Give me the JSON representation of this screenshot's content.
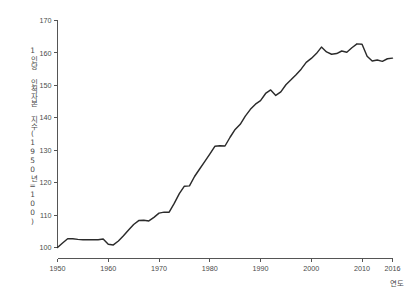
{
  "chart_data": {
    "type": "line",
    "title": "",
    "xlabel": "연도",
    "ylabel": "1인당 인적자본 지수(1950년=100)",
    "xlim": [
      1950,
      2016
    ],
    "ylim": [
      100,
      170
    ],
    "grid": false,
    "legend": "none",
    "xticks": [
      "1950",
      "1960",
      "1970",
      "1980",
      "1990",
      "2000",
      "2010",
      "2016"
    ],
    "xtick_values": [
      1950,
      1960,
      1970,
      1980,
      1990,
      2000,
      2010,
      2016
    ],
    "yticks": [
      "100",
      "110",
      "120",
      "130",
      "140",
      "150",
      "160",
      "170"
    ],
    "ytick_values": [
      100,
      110,
      120,
      130,
      140,
      150,
      160,
      170
    ],
    "line_color": "#2b2b2b",
    "axis_color": "#555555",
    "background_color": "#ffffff",
    "series": [
      {
        "name": "1인당 인적자본 지수",
        "x": [
          1950,
          1951,
          1952,
          1953,
          1954,
          1955,
          1956,
          1957,
          1958,
          1959,
          1960,
          1961,
          1962,
          1963,
          1964,
          1965,
          1966,
          1967,
          1968,
          1969,
          1970,
          1971,
          1972,
          1973,
          1974,
          1975,
          1976,
          1977,
          1978,
          1979,
          1980,
          1981,
          1982,
          1983,
          1984,
          1985,
          1986,
          1987,
          1988,
          1989,
          1990,
          1991,
          1992,
          1993,
          1994,
          1995,
          1996,
          1997,
          1998,
          1999,
          2000,
          2001,
          2002,
          2003,
          2004,
          2005,
          2006,
          2007,
          2008,
          2009,
          2010,
          2011,
          2012,
          2013,
          2014,
          2015,
          2016
        ],
        "values": [
          100.0,
          101.4,
          102.7,
          102.7,
          102.5,
          102.4,
          102.4,
          102.4,
          102.4,
          102.6,
          101.0,
          100.8,
          102.0,
          103.6,
          105.4,
          107.1,
          108.3,
          108.4,
          108.2,
          109.3,
          110.6,
          110.9,
          110.9,
          113.6,
          116.6,
          118.9,
          119.0,
          121.9,
          124.2,
          126.5,
          128.8,
          131.2,
          131.4,
          131.3,
          134.0,
          136.4,
          138.0,
          140.5,
          142.6,
          144.2,
          145.3,
          147.5,
          148.6,
          146.9,
          148.0,
          150.2,
          151.7,
          153.3,
          155.0,
          157.1,
          158.3,
          159.8,
          161.8,
          160.3,
          159.6,
          159.8,
          160.6,
          160.2,
          161.6,
          162.8,
          162.7,
          159.0,
          157.5,
          157.8,
          157.4,
          158.2,
          158.4
        ]
      }
    ]
  },
  "axes": {
    "y_title": "1인당 인적자본 지수(1950년=100)",
    "x_title": "연도"
  }
}
